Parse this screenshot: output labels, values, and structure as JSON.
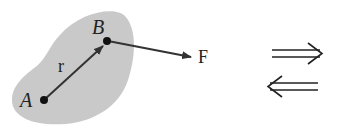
{
  "diagram": {
    "body_color": "#c9c9c9",
    "stroke_color": "#333333",
    "labels": {
      "point_a": "A",
      "point_b": "B",
      "position_vector": "r",
      "force": "F"
    },
    "arrows": {
      "implies": "right-double-arrow",
      "implied_by": "left-double-arrow"
    }
  }
}
